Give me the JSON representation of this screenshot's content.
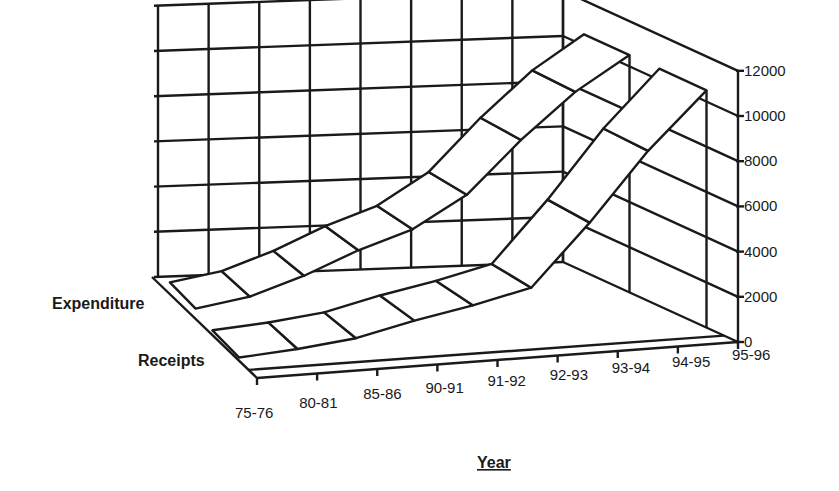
{
  "chart_data": {
    "type": "area",
    "subtype": "3d-ribbon",
    "title": "",
    "xlabel": "Year",
    "ylabel": "",
    "categories": [
      "75-76",
      "80-81",
      "85-86",
      "90-91",
      "91-92",
      "92-93",
      "93-94",
      "94-95",
      "95-96"
    ],
    "series": [
      {
        "name": "Expenditure",
        "values": [
          300,
          700,
          1500,
          2500,
          3300,
          4700,
          7000,
          9000,
          10500
        ]
      },
      {
        "name": "Receipts",
        "values": [
          100,
          300,
          600,
          1200,
          1700,
          2300,
          5000,
          8000,
          10500
        ]
      }
    ],
    "yticks": [
      0,
      2000,
      4000,
      6000,
      8000,
      10000,
      12000
    ],
    "ylim": [
      0,
      12000
    ],
    "grid": true,
    "legend": "series labels on depth axis (left)"
  },
  "labels": {
    "xlabel": "Year",
    "series_front": "Receipts",
    "series_back": "Expenditure"
  },
  "colors": {
    "line": "#1a1a1a",
    "fill": "#ffffff",
    "background": "#ffffff"
  }
}
